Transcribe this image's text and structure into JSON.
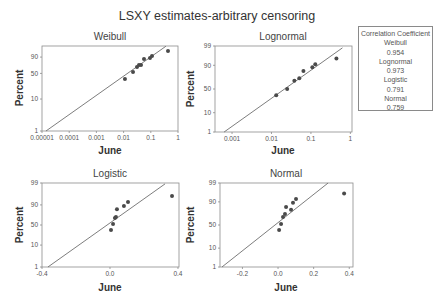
{
  "title": "LSXY estimates-arbitrary censoring",
  "legend": {
    "heading": "Correlation Coefficient",
    "entries": [
      {
        "name": "Weibull",
        "value": "0.954"
      },
      {
        "name": "Lognormal",
        "value": "0.973"
      },
      {
        "name": "Logistic",
        "value": "0.791"
      },
      {
        "name": "Normal",
        "value": "0.759"
      }
    ]
  },
  "chart_data": [
    {
      "type": "scatter",
      "title": "Weibull",
      "xlabel": "June",
      "ylabel": "Percent",
      "xscale": "log",
      "yscale": "weibull",
      "xlim": [
        1e-05,
        1
      ],
      "ylim": [
        1,
        99.45
      ],
      "xticks": [
        1e-05,
        0.0001,
        0.001,
        0.01,
        0.1,
        1
      ],
      "xtick_labels": [
        "0.00001",
        "0.0001",
        "0.001",
        "0.01",
        "0.1",
        "1"
      ],
      "yticks": [
        1,
        10,
        50,
        90
      ],
      "ytick_labels": [
        "1",
        "10",
        "50",
        "90"
      ],
      "points": {
        "x": [
          0.0112,
          0.0222,
          0.0311,
          0.0368,
          0.0437,
          0.0562,
          0.0933,
          0.1107,
          0.429
        ],
        "y": [
          36.7,
          53.7,
          67.1,
          72.4,
          72.4,
          86.5,
          88.4,
          91.8,
          97.3
        ]
      },
      "fit_line": {
        "x": [
          1.4e-05,
          0.36
        ],
        "y": [
          1,
          99.4
        ]
      },
      "correlation": 0.954
    },
    {
      "type": "scatter",
      "title": "Lognormal",
      "xlabel": "June",
      "ylabel": "Percent",
      "xscale": "log",
      "yscale": "normal",
      "xlim": [
        0.00037,
        1.1
      ],
      "ylim": [
        1,
        99
      ],
      "xticks": [
        0.001,
        0.01,
        0.1,
        1
      ],
      "xtick_labels": [
        "0.001",
        "0.01",
        "0.1",
        "1"
      ],
      "yticks": [
        1,
        10,
        50,
        90,
        99
      ],
      "ytick_labels": [
        "1",
        "10",
        "50",
        "90",
        "99"
      ],
      "points": {
        "x": [
          0.0132,
          0.025,
          0.038,
          0.0507,
          0.0645,
          0.1087,
          0.129,
          0.443
        ],
        "y": [
          37,
          50,
          67,
          72,
          83.5,
          88,
          91,
          95
        ]
      },
      "fit_line": {
        "x": [
          0.00063,
          0.63
        ],
        "y": [
          1,
          98.7
        ]
      },
      "correlation": 0.973
    },
    {
      "type": "scatter",
      "title": "Logistic",
      "xlabel": "June",
      "ylabel": "Percent",
      "xscale": "linear",
      "yscale": "logistic",
      "xlim": [
        -0.4,
        0.406
      ],
      "ylim": [
        1,
        99
      ],
      "xticks": [
        -0.4,
        0.0,
        0.4
      ],
      "xtick_labels": [
        "-0.4",
        "0.0",
        "0.4"
      ],
      "yticks": [
        1,
        10,
        50,
        90,
        99
      ],
      "ytick_labels": [
        "1",
        "10",
        "50",
        "90",
        "99"
      ],
      "points": {
        "x": [
          0.006,
          0.018,
          0.029,
          0.035,
          0.041,
          0.082,
          0.106,
          0.365
        ],
        "y": [
          36.6,
          52.7,
          68,
          70.7,
          85,
          89,
          92.6,
          96
        ]
      },
      "fit_line": {
        "x": [
          -0.365,
          0.324
        ],
        "y": [
          1,
          98.9
        ]
      },
      "correlation": 0.791
    },
    {
      "type": "scatter",
      "title": "Normal",
      "xlabel": "June",
      "ylabel": "Percent",
      "xscale": "linear",
      "yscale": "normal",
      "xlim": [
        -0.326,
        0.421
      ],
      "ylim": [
        1,
        99
      ],
      "xticks": [
        -0.2,
        0.0,
        0.2,
        0.4
      ],
      "xtick_labels": [
        "-0.2",
        "0.0",
        "0.2",
        "0.4"
      ],
      "yticks": [
        1,
        10,
        50,
        90,
        99
      ],
      "ytick_labels": [
        "1",
        "10",
        "50",
        "90",
        "99"
      ],
      "points": {
        "x": [
          0.006,
          0.017,
          0.028,
          0.039,
          0.045,
          0.073,
          0.084,
          0.101,
          0.371
        ],
        "y": [
          39,
          52,
          67,
          73,
          84,
          80,
          89,
          92.5,
          96
        ]
      },
      "fit_line": {
        "x": [
          -0.315,
          0.281
        ],
        "y": [
          1,
          99
        ]
      },
      "correlation": 0.759
    }
  ]
}
